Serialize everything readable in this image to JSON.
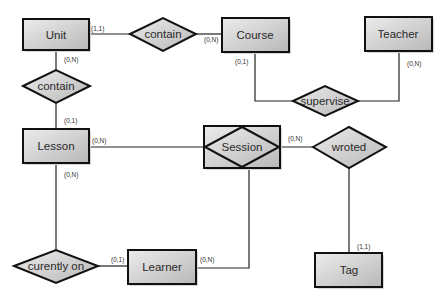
{
  "diagram": {
    "type": "entity-relationship",
    "colors": {
      "fill_light": "#e6e6e6",
      "fill_dark": "#bdbdbd",
      "stroke": "#111111",
      "shadow": "#d0d0d0"
    },
    "entities": [
      {
        "id": "unit",
        "label": "Unit"
      },
      {
        "id": "course",
        "label": "Course"
      },
      {
        "id": "teacher",
        "label": "Teacher"
      },
      {
        "id": "lesson",
        "label": "Lesson"
      },
      {
        "id": "session",
        "label": "Session",
        "weak": true
      },
      {
        "id": "learner",
        "label": "Learner"
      },
      {
        "id": "tag",
        "label": "Tag"
      }
    ],
    "relationships": [
      {
        "id": "contain_top",
        "label": "contain"
      },
      {
        "id": "contain_left",
        "label": "contain"
      },
      {
        "id": "supervise",
        "label": "supervise"
      },
      {
        "id": "wroted",
        "label": "wroted"
      },
      {
        "id": "curently_on",
        "label": "curently on"
      }
    ],
    "cardinalities": {
      "unit_contain_top": "(1,1)",
      "course_contain_top": "(0,N)",
      "unit_contain_left": "(0,N)",
      "lesson_contain_left": "(0,1)",
      "course_supervise": "(0,1)",
      "teacher_supervise": "(0,N)",
      "lesson_session": "(0,N)",
      "session_wroted": "(0,N)",
      "lesson_curently_on": "(0,N)",
      "learner_curently_on": "(0,1)",
      "learner_session": "(0,N)",
      "tag_wroted": "(1,1)"
    }
  }
}
